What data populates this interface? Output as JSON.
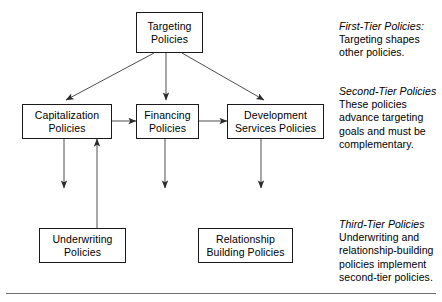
{
  "diagram": {
    "nodes": {
      "targeting": {
        "line1": "Targeting",
        "line2": "Policies"
      },
      "capitalization": {
        "line1": "Capitalization",
        "line2": "Policies"
      },
      "financing": {
        "line1": "Financing",
        "line2": "Policies"
      },
      "development_services": {
        "line1": "Development",
        "line2": "Services Policies"
      },
      "underwriting": {
        "line1": "Underwriting",
        "line2": "Policies"
      },
      "relationship_building": {
        "line1": "Relationship",
        "line2": "Building Policies"
      }
    },
    "notes": {
      "first_tier": {
        "heading": "First-Tier Policies",
        "heading_suffix": ":",
        "line1": "Targeting shapes",
        "line2": "other policies."
      },
      "second_tier": {
        "heading": "Second-Tier Policies",
        "line1": "These policies",
        "line2": "advance targeting",
        "line3": "goals and must be",
        "line4": "complementary."
      },
      "third_tier": {
        "heading": "Third-Tier Policies",
        "line1": "Underwriting and",
        "line2": "relationship-building",
        "line3": "policies implement",
        "line4": "second-tier policies."
      }
    },
    "colors": {
      "stroke": "#1a1a1a",
      "arrow": "#3a3a3a",
      "rule": "#6f6f6f",
      "background": "#ffffff"
    }
  }
}
